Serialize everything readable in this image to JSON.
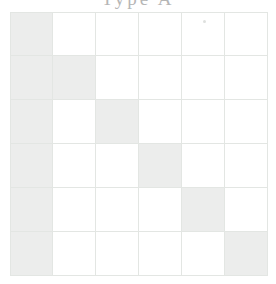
{
  "figure": {
    "title": "Type A",
    "title_note": "cropped-at-top-edge",
    "background_color": "#ffffff"
  },
  "grid": {
    "rows": 6,
    "cols": 6,
    "cell_size_px": 43,
    "origin_x_px": 10,
    "origin_y_px": 12,
    "gridline_color": "#e3e6e3",
    "filled_color": "#ecedec",
    "empty_color": "#ffffff"
  },
  "chart_data": {
    "type": "heatmap",
    "title": "Type A",
    "xlabel": "",
    "ylabel": "",
    "x": [
      1,
      2,
      3,
      4,
      5,
      6
    ],
    "y": [
      1,
      2,
      3,
      4,
      5,
      6
    ],
    "grid": true,
    "legend": "none",
    "value_levels": [
      0,
      1
    ],
    "values": [
      [
        1,
        0,
        0,
        0,
        0,
        0
      ],
      [
        1,
        1,
        0,
        0,
        0,
        0
      ],
      [
        1,
        0,
        1,
        0,
        0,
        0
      ],
      [
        1,
        0,
        0,
        1,
        0,
        0
      ],
      [
        1,
        0,
        0,
        0,
        1,
        0
      ],
      [
        1,
        0,
        0,
        0,
        0,
        1
      ]
    ],
    "annotations": [
      "column 1 filled in every row",
      "diagonal cells (i,i) filled"
    ]
  },
  "artifacts": {
    "speck_label": "scan-speck"
  }
}
